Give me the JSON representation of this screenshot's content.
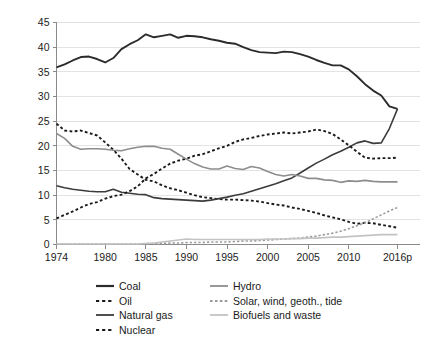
{
  "chart_data": {
    "type": "line",
    "title": "",
    "xlabel": "",
    "ylabel": "Percentage share",
    "xlim": [
      1974,
      2016
    ],
    "ylim": [
      0,
      45
    ],
    "grid": true,
    "grid_axis": "y",
    "legend_position": "bottom",
    "x_tick_labels": [
      "1974",
      "1980",
      "1985",
      "1990",
      "1995",
      "2000",
      "2005",
      "2010",
      "2016p"
    ],
    "x_tick_values": [
      1974,
      1980,
      1985,
      1990,
      1995,
      2000,
      2005,
      2010,
      2016
    ],
    "y_tick_labels": [
      "0",
      "5",
      "10",
      "15",
      "20",
      "25",
      "30",
      "35",
      "40",
      "45"
    ],
    "y_tick_values": [
      0,
      5,
      10,
      15,
      20,
      25,
      30,
      35,
      40,
      45
    ],
    "x": [
      1974,
      1975,
      1976,
      1977,
      1978,
      1979,
      1980,
      1981,
      1982,
      1983,
      1984,
      1985,
      1986,
      1987,
      1988,
      1989,
      1990,
      1991,
      1992,
      1993,
      1994,
      1995,
      1996,
      1997,
      1998,
      1999,
      2000,
      2001,
      2002,
      2003,
      2004,
      2005,
      2006,
      2007,
      2008,
      2009,
      2010,
      2011,
      2012,
      2013,
      2014,
      2015,
      2016
    ],
    "series": [
      {
        "name": "Coal",
        "style": "solid",
        "color": "#2b2b2b",
        "width": 1.9,
        "values": [
          35.9,
          36.5,
          37.3,
          38.0,
          38.1,
          37.6,
          36.9,
          37.8,
          39.6,
          40.6,
          41.4,
          42.6,
          42.0,
          42.3,
          42.6,
          41.9,
          42.3,
          42.2,
          42.0,
          41.6,
          41.3,
          40.9,
          40.7,
          40.0,
          39.4,
          39.0,
          38.9,
          38.8,
          39.1,
          39.0,
          38.6,
          38.1,
          37.4,
          36.8,
          36.3,
          36.3,
          35.5,
          34.1,
          32.5,
          31.2,
          30.2,
          28.0,
          27.5
        ]
      },
      {
        "name": "Oil",
        "style": "dotted",
        "color": "#1a1a1a",
        "width": 1.9,
        "values": [
          24.5,
          23.1,
          22.9,
          23.1,
          22.6,
          22.1,
          20.7,
          19.2,
          17.4,
          15.3,
          14.2,
          13.1,
          12.8,
          12.0,
          11.4,
          11.0,
          10.5,
          10.0,
          9.6,
          9.4,
          9.2,
          9.1,
          9.1,
          9.0,
          8.9,
          8.7,
          8.4,
          8.1,
          7.9,
          7.5,
          7.2,
          6.8,
          6.4,
          5.9,
          5.5,
          5.1,
          4.6,
          4.2,
          4.4,
          4.3,
          4.0,
          3.7,
          3.4
        ]
      },
      {
        "name": "Natural gas",
        "style": "solid",
        "color": "#3c3c3c",
        "width": 1.6,
        "values": [
          11.9,
          11.5,
          11.2,
          11.0,
          10.8,
          10.7,
          10.7,
          11.2,
          10.6,
          10.4,
          10.2,
          10.1,
          9.5,
          9.3,
          9.2,
          9.1,
          9.0,
          8.9,
          8.8,
          9.0,
          9.3,
          9.6,
          10.0,
          10.3,
          10.8,
          11.3,
          11.8,
          12.3,
          12.9,
          13.5,
          14.5,
          15.5,
          16.5,
          17.3,
          18.2,
          18.9,
          19.7,
          20.6,
          21.0,
          20.5,
          20.6,
          23.5,
          27.5
        ]
      },
      {
        "name": "Nuclear",
        "style": "dotted",
        "color": "#1a1a1a",
        "width": 1.9,
        "values": [
          5.3,
          6.0,
          6.7,
          7.5,
          8.2,
          8.6,
          9.3,
          9.8,
          10.1,
          10.8,
          11.8,
          13.4,
          14.3,
          15.4,
          16.4,
          17.0,
          17.4,
          18.0,
          18.3,
          18.9,
          19.5,
          20.0,
          20.8,
          21.3,
          21.6,
          22.0,
          22.3,
          22.5,
          22.7,
          22.5,
          22.7,
          22.9,
          23.3,
          23.0,
          22.4,
          21.3,
          20.1,
          18.8,
          17.6,
          17.4,
          17.5,
          17.5,
          17.6
        ]
      },
      {
        "name": "Hydro",
        "style": "solid",
        "color": "#8d8d8d",
        "width": 1.6,
        "values": [
          22.5,
          21.5,
          19.9,
          19.3,
          19.4,
          19.4,
          19.3,
          19.1,
          19.0,
          19.4,
          19.7,
          19.9,
          19.9,
          19.5,
          19.3,
          18.3,
          17.3,
          16.4,
          15.7,
          15.3,
          15.3,
          15.9,
          15.4,
          15.2,
          15.8,
          15.5,
          14.8,
          14.2,
          13.9,
          14.2,
          13.9,
          13.4,
          13.4,
          13.1,
          13.0,
          12.6,
          12.9,
          12.8,
          13.0,
          12.8,
          12.7,
          12.7,
          12.7
        ]
      },
      {
        "name": "Solar, wind, geoth., tide",
        "style": "dotted",
        "color": "#9a9a9a",
        "width": 1.6,
        "values": [
          0.1,
          0.1,
          0.1,
          0.1,
          0.1,
          0.1,
          0.1,
          0.1,
          0.1,
          0.1,
          0.1,
          0.2,
          0.2,
          0.2,
          0.3,
          0.3,
          0.4,
          0.4,
          0.4,
          0.5,
          0.5,
          0.5,
          0.6,
          0.7,
          0.7,
          0.8,
          0.9,
          1.0,
          1.1,
          1.2,
          1.3,
          1.5,
          1.7,
          2.0,
          2.3,
          2.7,
          3.2,
          3.8,
          4.4,
          5.2,
          6.0,
          6.8,
          7.5
        ]
      },
      {
        "name": "Biofuels and waste",
        "style": "solid",
        "color": "#c3c3c3",
        "width": 1.6,
        "values": [
          0.1,
          0.1,
          0.1,
          0.1,
          0.1,
          0.1,
          0.1,
          0.1,
          0.1,
          0.1,
          0.1,
          0.2,
          0.3,
          0.5,
          0.7,
          0.9,
          1.1,
          1.0,
          1.0,
          1.0,
          1.0,
          1.0,
          1.0,
          1.0,
          1.0,
          1.0,
          1.1,
          1.1,
          1.1,
          1.2,
          1.2,
          1.3,
          1.3,
          1.4,
          1.5,
          1.5,
          1.6,
          1.7,
          1.8,
          1.9,
          2.0,
          2.0,
          2.0
        ]
      }
    ]
  },
  "axis": {
    "y_title": "Percentage share"
  },
  "legend": {
    "columns": [
      {
        "items": [
          {
            "label": "Coal",
            "style": "solid",
            "color": "#2b2b2b",
            "width": 2.2
          },
          {
            "label": "Oil",
            "style": "dotted",
            "color": "#1a1a1a",
            "width": 2.2
          },
          {
            "label": "Natural gas",
            "style": "solid",
            "color": "#3c3c3c",
            "width": 1.8
          },
          {
            "label": "Nuclear",
            "style": "dotted",
            "color": "#1a1a1a",
            "width": 2.2
          }
        ]
      },
      {
        "items": [
          {
            "label": "Hydro",
            "style": "solid",
            "color": "#8d8d8d",
            "width": 1.8
          },
          {
            "label": "Solar, wind, geoth., tide",
            "style": "dotted",
            "color": "#9a9a9a",
            "width": 1.8
          },
          {
            "label": "Biofuels and waste",
            "style": "solid",
            "color": "#c3c3c3",
            "width": 1.8
          }
        ]
      }
    ]
  },
  "colors": {
    "grid": "#e3e3e3",
    "axis": "#8a8a8a",
    "text": "#222222",
    "background": "#ffffff"
  }
}
